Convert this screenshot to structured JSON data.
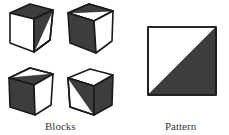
{
  "colors": {
    "dark": "#3d3d3d",
    "light": "#ffffff",
    "stroke": "#1a1a1a"
  },
  "blocks": {
    "label": "Blocks",
    "items": [
      {
        "id": "block-1",
        "top": "dark",
        "front": "white",
        "right": "split-diagonal (upper dark, lower white)"
      },
      {
        "id": "block-2",
        "top": "split (back dark, front white)",
        "front": "dark",
        "right": "white"
      },
      {
        "id": "block-3",
        "top": "split (back white, front dark)",
        "front": "dark",
        "right": "white"
      },
      {
        "id": "block-4",
        "top": "white",
        "front": "split-diagonal (upper-right dark, lower-left white)",
        "right": "dark"
      }
    ]
  },
  "pattern": {
    "label": "Pattern",
    "description": "square divided by diagonal: upper-left white, lower-right dark"
  }
}
